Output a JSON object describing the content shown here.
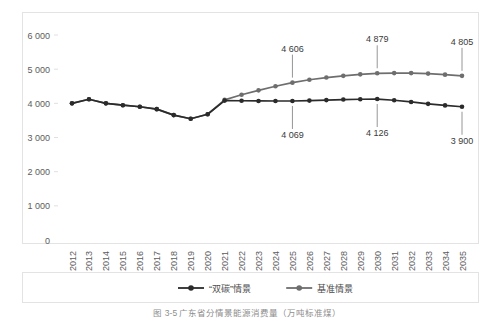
{
  "chart_data": {
    "type": "line",
    "title": "",
    "xlabel": "",
    "ylabel": "",
    "ylim": [
      0,
      6000
    ],
    "grid": false,
    "legend_position": "bottom",
    "x": [
      "2012",
      "2013",
      "2014",
      "2015",
      "2016",
      "2017",
      "2018",
      "2019",
      "2020",
      "2021",
      "2022",
      "2023",
      "2024",
      "2025",
      "2026",
      "2027",
      "2028",
      "2029",
      "2030",
      "2031",
      "2032",
      "2033",
      "2034",
      "2035"
    ],
    "ytick_labels": [
      "0",
      "1 000",
      "2 000",
      "3 000",
      "4 000",
      "5 000",
      "6 000"
    ],
    "ytick_values": [
      0,
      1000,
      2000,
      3000,
      4000,
      5000,
      6000
    ],
    "series": [
      {
        "name": "“双碳”情景",
        "color": "#2b2b2b",
        "values": [
          4000,
          4120,
          4000,
          3945,
          3900,
          3830,
          3655,
          3550,
          3680,
          4080,
          4075,
          4070,
          4068,
          4069,
          4080,
          4095,
          4110,
          4120,
          4126,
          4090,
          4040,
          3985,
          3940,
          3900
        ]
      },
      {
        "name": "基准情景",
        "color": "#6e6e6e",
        "values": [
          4000,
          4120,
          4000,
          3945,
          3900,
          3830,
          3655,
          3550,
          3680,
          4100,
          4250,
          4380,
          4500,
          4606,
          4690,
          4755,
          4805,
          4848,
          4879,
          4885,
          4885,
          4870,
          4840,
          4805
        ]
      }
    ],
    "annotations": [
      {
        "text": "4 606",
        "series": "基准情景",
        "x": "2025",
        "value": 4606,
        "side": "above"
      },
      {
        "text": "4 879",
        "series": "基准情景",
        "x": "2030",
        "value": 4879,
        "side": "above"
      },
      {
        "text": "4 805",
        "series": "基准情景",
        "x": "2035",
        "value": 4805,
        "side": "above"
      },
      {
        "text": "4 069",
        "series": "“双碳”情景",
        "x": "2025",
        "value": 4069,
        "side": "below"
      },
      {
        "text": "4 126",
        "series": "“双碳”情景",
        "x": "2030",
        "value": 4126,
        "side": "below"
      },
      {
        "text": "3 900",
        "series": "“双碳”情景",
        "x": "2035",
        "value": 3900,
        "side": "below"
      }
    ]
  },
  "legend": {
    "items": [
      {
        "label": "“双碳”情景",
        "color": "#2b2b2b"
      },
      {
        "label": "基准情景",
        "color": "#6e6e6e"
      }
    ]
  },
  "caption": {
    "text": "图 3-5   广东省分情景能源消费量（万吨标准煤）"
  },
  "colors": {
    "axis": "#d9d9d9",
    "border": "#e3e3e3",
    "tick_text": "#5c5c5c",
    "label_text": "#3a3a3a",
    "background": "#ffffff"
  }
}
